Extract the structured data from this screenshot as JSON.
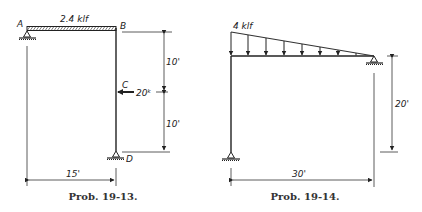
{
  "problems": [
    {
      "id": "19-13",
      "caption": "Prob. 19-13.",
      "joints": {
        "a": "A",
        "b": "B",
        "c": "C",
        "d": "D"
      },
      "distributed_load_label": "2.4 klf",
      "point_load_label": "20ᵏ",
      "dimensions": {
        "upper_vertical": "10'",
        "lower_vertical": "10'",
        "horizontal": "15'"
      }
    },
    {
      "id": "19-14",
      "caption": "Prob. 19-14.",
      "triangular_load_label": "4 klf",
      "dimensions": {
        "vertical": "20'",
        "horizontal": "30'"
      }
    }
  ]
}
